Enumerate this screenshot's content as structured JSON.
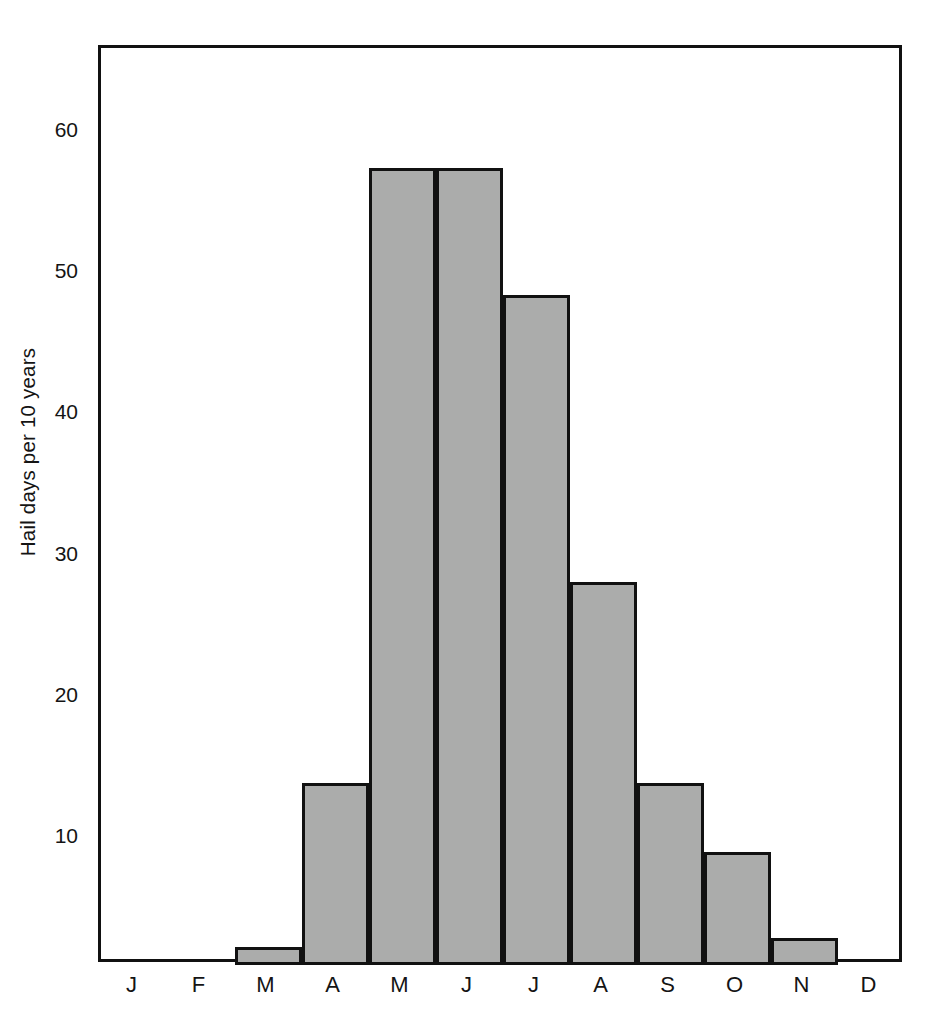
{
  "chart_data": {
    "type": "bar",
    "title": "",
    "subtitle": "",
    "xlabel": "",
    "ylabel": "Hail days per 10 years",
    "categories": [
      "J",
      "F",
      "M",
      "A",
      "M",
      "J",
      "J",
      "A",
      "S",
      "O",
      "N",
      "D"
    ],
    "category_names": [
      "January",
      "February",
      "March",
      "April",
      "May",
      "June",
      "July",
      "August",
      "September",
      "October",
      "November",
      "December"
    ],
    "values": [
      0,
      0,
      2.4,
      14.0,
      57.5,
      57.5,
      48.5,
      28.2,
      14.0,
      9.1,
      3.0,
      0
    ],
    "ytick_labels": [
      "10",
      "20",
      "30",
      "40",
      "50",
      "60"
    ],
    "ytick_values": [
      10,
      20,
      30,
      40,
      50,
      60
    ],
    "xtick_labels": [
      "J",
      "F",
      "M",
      "A",
      "M",
      "J",
      "J",
      "A",
      "S",
      "O",
      "N",
      "D"
    ],
    "ylim": [
      1.1,
      66.0
    ],
    "xlim": [
      0,
      12
    ],
    "grid": false,
    "legend": null,
    "bar_fill_color": "#abacab",
    "bar_edge_color": "#111111",
    "axis_color": "#111111",
    "background_color": "#ffffff",
    "bar_style": "histogram-adjacent"
  }
}
